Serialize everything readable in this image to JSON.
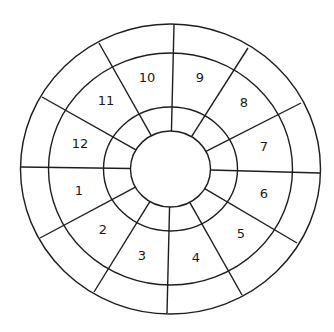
{
  "diagram": {
    "type": "segmented-ring",
    "ring_count": 4,
    "segment_count": 12,
    "line_color": "#1e1e1e",
    "segments": [
      {
        "id": 1,
        "label": "1"
      },
      {
        "id": 2,
        "label": "2"
      },
      {
        "id": 3,
        "label": "3"
      },
      {
        "id": 4,
        "label": "4"
      },
      {
        "id": 5,
        "label": "5"
      },
      {
        "id": 6,
        "label": "6"
      },
      {
        "id": 7,
        "label": "7"
      },
      {
        "id": 8,
        "label": "8"
      },
      {
        "id": 9,
        "label": "9"
      },
      {
        "id": 10,
        "label": "10"
      },
      {
        "id": 11,
        "label": "11"
      },
      {
        "id": 12,
        "label": "12"
      }
    ]
  }
}
